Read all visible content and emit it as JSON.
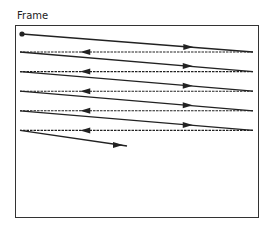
{
  "diagram": {
    "title": "Frame",
    "scan_rows": 5,
    "line_color": "#222222",
    "icons": {
      "start": "start-dot-icon"
    }
  }
}
